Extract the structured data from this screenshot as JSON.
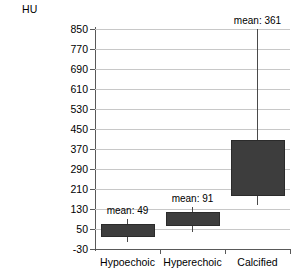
{
  "chart_data": {
    "type": "box",
    "title": "",
    "xlabel": "",
    "ylabel": "HU",
    "ylim": [
      -30,
      850
    ],
    "yticks": [
      850,
      770,
      690,
      610,
      530,
      450,
      370,
      290,
      210,
      130,
      50,
      -30
    ],
    "grid": true,
    "legend": "none",
    "categories": [
      "Hypoechoic",
      "Hyperechoic",
      "Calcified"
    ],
    "series": [
      {
        "name": "Hypoechoic",
        "mean": 49,
        "mean_label": "mean: 49",
        "box_low": 17,
        "box_high": 70,
        "whisker_low": 0,
        "whisker_high": 90
      },
      {
        "name": "Hyperechoic",
        "mean": 91,
        "mean_label": "mean: 91",
        "box_low": 62,
        "box_high": 118,
        "whisker_low": 40,
        "whisker_high": 140
      },
      {
        "name": "Calcified",
        "mean": 361,
        "mean_label": "mean: 361",
        "box_low": 182,
        "box_high": 406,
        "whisker_low": 146,
        "whisker_high": 850
      }
    ],
    "colors": {
      "box_fill": "#3d3d3d",
      "box_edge": "#2b2b2b",
      "grid": "#c8c8c8",
      "axis": "#595959",
      "text": "#000000",
      "background": "#ffffff"
    }
  }
}
